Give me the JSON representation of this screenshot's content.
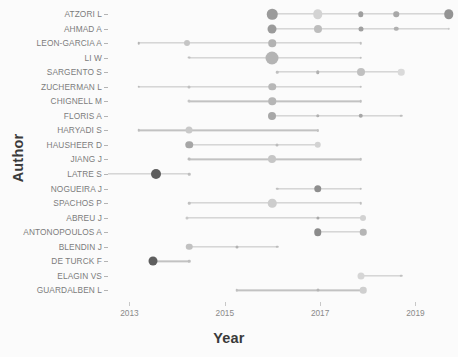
{
  "chart_data": {
    "type": "scatter",
    "title": "",
    "xlabel": "Year",
    "ylabel": "Author",
    "xlim": [
      2012.55,
      2019.85
    ],
    "xticks": [
      2013,
      2015,
      2017,
      2019
    ],
    "xtick_labels": [
      "2013",
      "2015",
      "2017",
      "2019"
    ],
    "grid": false,
    "legend": "none",
    "note": "Author production over time: circle area encodes number of documents per year, circle gray level encodes citation intensity; horizontal line spans first-to-last active year.",
    "categories": [
      "ATZORI L",
      "AHMAD A",
      "LEON-GARCIA A",
      "LI W",
      "SARGENTO S",
      "ZUCHERMAN L",
      "CHIGNELL M",
      "FLORIS A",
      "HARYADI S",
      "HAUSHEER D",
      "JIANG J",
      "LATRE S",
      "NOGUEIRA J",
      "SPACHOS P",
      "ABREU J",
      "ANTONOPOULOS A",
      "BLENDIN J",
      "DE TURCK F",
      "ELAGIN VS",
      "GUARDALBEN L"
    ],
    "series": [
      {
        "name": "ATZORI L",
        "span": [
          2016.0,
          2019.7
        ],
        "points": [
          {
            "year": 2016.0,
            "size": 10.5,
            "shade": "#9b9b9b"
          },
          {
            "year": 2016.95,
            "size": 9.5,
            "shade": "#d3d3d3"
          },
          {
            "year": 2017.85,
            "size": 5.5,
            "shade": "#9f9f9f"
          },
          {
            "year": 2018.6,
            "size": 5.5,
            "shade": "#a8a8a8"
          },
          {
            "year": 2019.7,
            "size": 9.5,
            "shade": "#949494"
          }
        ]
      },
      {
        "name": "AHMAD A",
        "span": [
          2016.0,
          2019.7
        ],
        "points": [
          {
            "year": 2016.0,
            "size": 9.0,
            "shade": "#9b9b9b"
          },
          {
            "year": 2016.95,
            "size": 8.0,
            "shade": "#bdbdbd"
          },
          {
            "year": 2017.85,
            "size": 5.0,
            "shade": "#a0a0a0"
          },
          {
            "year": 2018.6,
            "size": 4.5,
            "shade": "#b0b0b0"
          },
          {
            "year": 2019.7,
            "size": 2.5,
            "shade": "#c8c8c8"
          }
        ]
      },
      {
        "name": "LEON-GARCIA A",
        "span": [
          2013.2,
          2017.85
        ],
        "points": [
          {
            "year": 2013.2,
            "size": 2.5,
            "shade": "#b5b5b5"
          },
          {
            "year": 2014.2,
            "size": 6.0,
            "shade": "#c5c5c5"
          },
          {
            "year": 2016.0,
            "size": 7.5,
            "shade": "#b3b3b3"
          },
          {
            "year": 2017.85,
            "size": 2.5,
            "shade": "#c0c0c0"
          }
        ]
      },
      {
        "name": "LI W",
        "span": [
          2014.25,
          2017.85
        ],
        "points": [
          {
            "year": 2014.25,
            "size": 2.8,
            "shade": "#c0c0c0"
          },
          {
            "year": 2016.0,
            "size": 13.0,
            "shade": "#b4b4b4"
          },
          {
            "year": 2017.85,
            "size": 2.5,
            "shade": "#c0c0c0"
          }
        ]
      },
      {
        "name": "SARGENTO S",
        "span": [
          2016.1,
          2018.7
        ],
        "points": [
          {
            "year": 2016.1,
            "size": 2.5,
            "shade": "#c0c0c0"
          },
          {
            "year": 2016.95,
            "size": 3.5,
            "shade": "#b0b0b0"
          },
          {
            "year": 2017.85,
            "size": 8.0,
            "shade": "#c0c0c0"
          },
          {
            "year": 2018.7,
            "size": 6.5,
            "shade": "#dadada"
          }
        ]
      },
      {
        "name": "ZUCHERMAN L",
        "span": [
          2013.2,
          2017.85
        ],
        "points": [
          {
            "year": 2013.2,
            "size": 2.5,
            "shade": "#bbbbbb"
          },
          {
            "year": 2014.25,
            "size": 3.0,
            "shade": "#c0c0c0"
          },
          {
            "year": 2016.0,
            "size": 7.5,
            "shade": "#b8b8b8"
          },
          {
            "year": 2017.85,
            "size": 2.5,
            "shade": "#c0c0c0"
          }
        ]
      },
      {
        "name": "CHIGNELL M",
        "span": [
          2014.25,
          2017.85
        ],
        "points": [
          {
            "year": 2014.25,
            "size": 3.0,
            "shade": "#c5c5c5"
          },
          {
            "year": 2016.0,
            "size": 7.5,
            "shade": "#b6b6b6"
          },
          {
            "year": 2017.85,
            "size": 2.5,
            "shade": "#c0c0c0"
          }
        ]
      },
      {
        "name": "FLORIS A",
        "span": [
          2016.0,
          2018.7
        ],
        "points": [
          {
            "year": 2016.0,
            "size": 8.0,
            "shade": "#a8a8a8"
          },
          {
            "year": 2016.95,
            "size": 3.5,
            "shade": "#b0b0b0"
          },
          {
            "year": 2017.85,
            "size": 4.5,
            "shade": "#a6a6a6"
          },
          {
            "year": 2018.7,
            "size": 2.5,
            "shade": "#bdbdbd"
          }
        ]
      },
      {
        "name": "HARYADI S",
        "span": [
          2013.2,
          2016.95
        ],
        "points": [
          {
            "year": 2013.2,
            "size": 2.5,
            "shade": "#bdbdbd"
          },
          {
            "year": 2014.25,
            "size": 7.0,
            "shade": "#c9c9c9"
          },
          {
            "year": 2016.95,
            "size": 2.2,
            "shade": "#c2c2c2"
          }
        ]
      },
      {
        "name": "HAUSHEER D",
        "span": [
          2014.25,
          2016.95
        ],
        "points": [
          {
            "year": 2014.25,
            "size": 7.5,
            "shade": "#a6a6a6"
          },
          {
            "year": 2016.1,
            "size": 3.0,
            "shade": "#bcbcbc"
          },
          {
            "year": 2016.95,
            "size": 6.5,
            "shade": "#d3d3d3"
          }
        ]
      },
      {
        "name": "JIANG J",
        "span": [
          2014.25,
          2017.85
        ],
        "points": [
          {
            "year": 2014.25,
            "size": 2.8,
            "shade": "#bcbcbc"
          },
          {
            "year": 2016.0,
            "size": 8.0,
            "shade": "#c6c6c6"
          },
          {
            "year": 2017.85,
            "size": 2.5,
            "shade": "#bfbfbf"
          }
        ]
      },
      {
        "name": "LATRE S",
        "span": [
          2012.55,
          2014.25
        ],
        "points": [
          {
            "year": 2013.55,
            "size": 10.0,
            "shade": "#5e5e5e"
          },
          {
            "year": 2014.25,
            "size": 2.5,
            "shade": "#bebebe"
          }
        ]
      },
      {
        "name": "NOGUEIRA J",
        "span": [
          2016.1,
          2017.85
        ],
        "points": [
          {
            "year": 2016.1,
            "size": 2.5,
            "shade": "#c0c0c0"
          },
          {
            "year": 2016.95,
            "size": 7.5,
            "shade": "#8e8e8e"
          },
          {
            "year": 2017.85,
            "size": 2.5,
            "shade": "#bfbfbf"
          }
        ]
      },
      {
        "name": "SPACHOS P",
        "span": [
          2014.25,
          2017.85
        ],
        "points": [
          {
            "year": 2014.25,
            "size": 2.5,
            "shade": "#c0c0c0"
          },
          {
            "year": 2016.0,
            "size": 8.5,
            "shade": "#cdcdcd"
          },
          {
            "year": 2017.85,
            "size": 2.5,
            "shade": "#bfbfbf"
          }
        ]
      },
      {
        "name": "ABREU J",
        "span": [
          2014.2,
          2017.9
        ],
        "points": [
          {
            "year": 2014.2,
            "size": 3.0,
            "shade": "#c8c8c8"
          },
          {
            "year": 2016.95,
            "size": 3.2,
            "shade": "#a9a9a9"
          },
          {
            "year": 2017.9,
            "size": 6.0,
            "shade": "#d2d2d2"
          }
        ]
      },
      {
        "name": "ANTONOPOULOS A",
        "span": [
          2016.95,
          2017.9
        ],
        "points": [
          {
            "year": 2016.95,
            "size": 7.5,
            "shade": "#8b8b8b"
          },
          {
            "year": 2017.9,
            "size": 6.5,
            "shade": "#b5b5b5"
          }
        ]
      },
      {
        "name": "BLENDIN J",
        "span": [
          2014.25,
          2016.1
        ],
        "points": [
          {
            "year": 2014.25,
            "size": 6.5,
            "shade": "#c1c1c1"
          },
          {
            "year": 2015.25,
            "size": 3.0,
            "shade": "#b2b2b2"
          },
          {
            "year": 2016.1,
            "size": 2.5,
            "shade": "#bcbcbc"
          }
        ]
      },
      {
        "name": "DE TURCK F",
        "span": [
          2013.5,
          2014.25
        ],
        "points": [
          {
            "year": 2013.5,
            "size": 9.0,
            "shade": "#5e5e5e"
          },
          {
            "year": 2014.25,
            "size": 2.5,
            "shade": "#bebebe"
          }
        ]
      },
      {
        "name": "ELAGIN VS",
        "span": [
          2017.85,
          2018.7
        ],
        "points": [
          {
            "year": 2017.85,
            "size": 7.0,
            "shade": "#d6d6d6"
          },
          {
            "year": 2018.7,
            "size": 2.5,
            "shade": "#c0c0c0"
          }
        ]
      },
      {
        "name": "GUARDALBEN L",
        "span": [
          2015.25,
          2017.9
        ],
        "points": [
          {
            "year": 2015.25,
            "size": 2.5,
            "shade": "#c0c0c0"
          },
          {
            "year": 2016.95,
            "size": 3.0,
            "shade": "#b5b5b5"
          },
          {
            "year": 2017.9,
            "size": 6.5,
            "shade": "#cfcfcf"
          }
        ]
      }
    ]
  }
}
